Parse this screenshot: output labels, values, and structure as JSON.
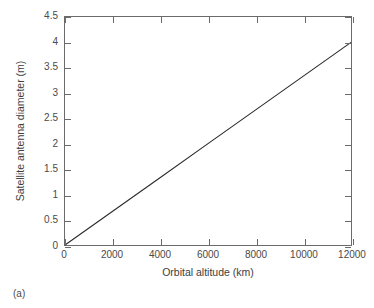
{
  "figure": {
    "caption": "(a)",
    "background_color": "#ffffff",
    "frame_color": "#6b6b6b",
    "line_color": "#2b2b2b"
  },
  "chart_data": {
    "type": "line",
    "title": "",
    "xlabel": "Orbital altitude (km)",
    "ylabel": "Satellite antenna diameter (m)",
    "xlim": [
      0,
      12000
    ],
    "ylim": [
      0,
      4.5
    ],
    "xticks": [
      0,
      2000,
      4000,
      6000,
      8000,
      10000,
      12000
    ],
    "xtick_labels": [
      "0",
      "2000",
      "4000",
      "6000",
      "8000",
      "10000",
      "12000"
    ],
    "yticks": [
      0,
      0.5,
      1,
      1.5,
      2,
      2.5,
      3,
      3.5,
      4,
      4.5
    ],
    "ytick_labels": [
      "0",
      "0.5",
      "1",
      "1.5",
      "2",
      "2.5",
      "3",
      "3.5",
      "4",
      "4.5"
    ],
    "grid": false,
    "legend": null,
    "series": [
      {
        "name": "Satellite antenna diameter",
        "x": [
          0,
          2000,
          4000,
          6000,
          8000,
          10000,
          12000
        ],
        "values": [
          0,
          0.667,
          1.333,
          2.0,
          2.667,
          3.333,
          4.0
        ]
      }
    ],
    "annotations": []
  }
}
